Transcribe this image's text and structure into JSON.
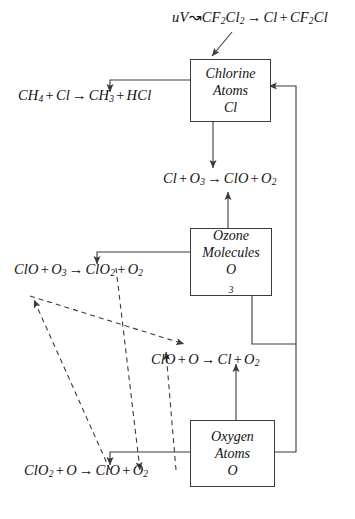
{
  "diagram": {
    "line_color": "#3b3b3b",
    "text_color": "#111111",
    "background": "#ffffff"
  },
  "boxes": [
    {
      "id": "chlorine",
      "line1": "Chlorine",
      "line2": "Atoms",
      "line3": "Cl"
    },
    {
      "id": "ozone",
      "line1": "Ozone",
      "line2": "Molecules",
      "line3": "O",
      "sub3": "3"
    },
    {
      "id": "oxygen",
      "line1": "Oxygen",
      "line2": "Atoms",
      "line3": "O"
    }
  ],
  "equations": {
    "photolysis": {
      "id": "eq-photolysis",
      "uv": "uV",
      "squiggle": "↝",
      "reactant": "CF",
      "reactant_sub1": "2",
      "reactant_mid": "Cl",
      "reactant_sub2": "2",
      "arrow": "→",
      "product1": "Cl",
      "plus": "+",
      "product2": "CF",
      "product2_sub": "2",
      "product2_tail": "Cl",
      "full_text": "uV↝CF2Cl2 → Cl + CF2Cl"
    },
    "methane": {
      "id": "eq-methane",
      "full_text": "CH4 + Cl → CH3 + HCl",
      "r1": "CH",
      "r1_sub": "4",
      "plus1": "+",
      "r2": "Cl",
      "arrow": "→",
      "p1": "CH",
      "p1_sub": "3",
      "plus2": "+",
      "p2": "HCl"
    },
    "ozone_destruction": {
      "id": "eq-ozone-destruction",
      "full_text": "Cl + O3 → ClO + O2",
      "r1": "Cl",
      "plus1": "+",
      "r2": "O",
      "r2_sub": "3",
      "arrow": "→",
      "p1": "ClO",
      "plus2": "+",
      "p2": "O",
      "p2_sub": "2"
    },
    "clo_ozone": {
      "id": "eq-clo-ozone",
      "full_text": "ClO + O3 → ClO2 + O2",
      "r1": "ClO",
      "plus1": "+",
      "r2": "O",
      "r2_sub": "3",
      "arrow": "→",
      "p1": "ClO",
      "p1_sub": "2",
      "plus2": "+",
      "p2": "O",
      "p2_sub": "2"
    },
    "clo_oxygen": {
      "id": "eq-clo-oxygen",
      "full_text": "ClO + O → Cl + O2",
      "r1": "ClO",
      "plus1": "+",
      "r2": "O",
      "arrow": "→",
      "p1": "Cl",
      "plus2": "+",
      "p2": "O",
      "p2_sub": "2"
    },
    "clo2_oxygen": {
      "id": "eq-clo2-oxygen",
      "full_text": "ClO2 + O → ClO + O2",
      "r1": "ClO",
      "r1_sub": "2",
      "plus1": "+",
      "r2": "O",
      "arrow": "→",
      "p1": "ClO",
      "plus2": "+",
      "p2": "O",
      "p2_sub": "2"
    }
  }
}
